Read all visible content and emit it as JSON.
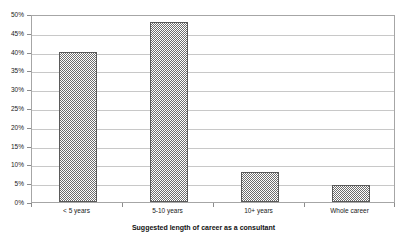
{
  "chart_data": {
    "type": "bar",
    "title": "",
    "subtitle": "",
    "xlabel": "Suggested length of career as a consultant",
    "ylabel": "",
    "categories": [
      "< 5 years",
      "5-10 years",
      "10+ years",
      "Whole career"
    ],
    "values": [
      40,
      48,
      8,
      4.5
    ],
    "value_labels": [
      "40%",
      "48%",
      "8%",
      "4.5%"
    ],
    "ylim": [
      0,
      50
    ],
    "ytick_labels": [
      "0%",
      "5%",
      "10%",
      "15%",
      "20%",
      "25%",
      "30%",
      "35%",
      "40%",
      "45%",
      "50%"
    ],
    "ytick_values": [
      0,
      5,
      10,
      15,
      20,
      25,
      30,
      35,
      40,
      45,
      50
    ],
    "ytick_step": 5,
    "grid": true,
    "grid_axis": "y",
    "legend": false,
    "legend_position": "none",
    "series": [
      {
        "name": "Suggested length of career",
        "values": [
          40,
          48,
          8,
          4.5
        ],
        "fill": "gray-checker-pattern",
        "fill_color": "#6e6e6e",
        "border_color": "#5a5a5a"
      }
    ],
    "colors": {
      "plot_background": "#ffffff",
      "chart_background": "#ffffff",
      "gridline": "#c8c8c8",
      "axis_line": "#a6a6a6",
      "tick_mark": "#8c8c8c",
      "bar_fill": "#6e6e6e",
      "bar_border": "#5a5a5a",
      "text": "#1a1a1a"
    }
  }
}
